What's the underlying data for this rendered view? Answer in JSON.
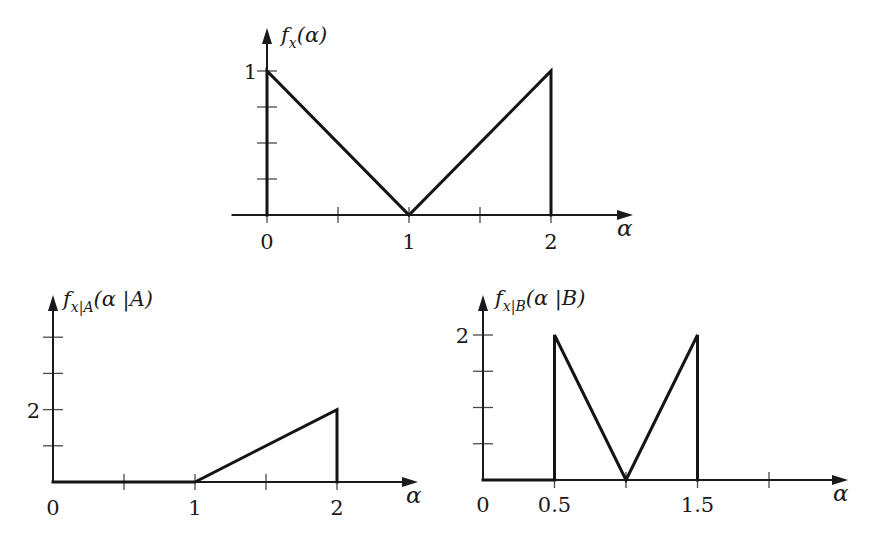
{
  "chart_data": [
    {
      "id": "fx",
      "type": "line",
      "title": "f_x(α)",
      "ylabel": {
        "main": "f",
        "sub": "x",
        "args": "(α)"
      },
      "xlabel": "α",
      "points": [
        [
          0,
          0
        ],
        [
          0,
          1
        ],
        [
          1,
          0
        ],
        [
          2,
          1
        ],
        [
          2,
          0
        ]
      ],
      "x_axis_start": -0.25,
      "x_ticks": [
        0,
        0.5,
        1,
        1.5,
        2
      ],
      "x_tick_labels": [
        {
          "x": 0,
          "label": "0"
        },
        {
          "x": 1,
          "label": "1"
        },
        {
          "x": 2,
          "label": "2"
        }
      ],
      "y_ticks": [
        0.25,
        0.5,
        0.75,
        1
      ],
      "y_tick_labels": [
        {
          "y": 1,
          "label": "1"
        }
      ],
      "xlim": [
        -0.25,
        2.6
      ],
      "ylim": [
        0,
        1.3
      ],
      "grid": false
    },
    {
      "id": "fx_given_A",
      "type": "line",
      "title": "f_x|A(α|A)",
      "ylabel": {
        "main": "f",
        "sub": "x|A",
        "args": "(α |A)"
      },
      "xlabel": "α",
      "points": [
        [
          0,
          0
        ],
        [
          1,
          0
        ],
        [
          2,
          2
        ],
        [
          2,
          0
        ]
      ],
      "x_axis_start": 0,
      "x_ticks": [
        0.5,
        1,
        1.5,
        2
      ],
      "x_tick_labels": [
        {
          "x": 0,
          "label": "0"
        },
        {
          "x": 1,
          "label": "1"
        },
        {
          "x": 2,
          "label": "2"
        }
      ],
      "y_ticks": [
        1,
        2,
        3,
        4
      ],
      "y_tick_labels": [
        {
          "y": 2,
          "label": "2"
        }
      ],
      "xlim": [
        0,
        2.6
      ],
      "ylim": [
        0,
        5.2
      ],
      "grid": false
    },
    {
      "id": "fx_given_B",
      "type": "line",
      "title": "f_x|B(α|B)",
      "ylabel": {
        "main": "f",
        "sub": "x|B",
        "args": "(α |B)"
      },
      "xlabel": "α",
      "points": [
        [
          0,
          0
        ],
        [
          0.5,
          0
        ],
        [
          0.5,
          2
        ],
        [
          1,
          0
        ],
        [
          1.5,
          2
        ],
        [
          1.5,
          0
        ]
      ],
      "x_axis_start": 0,
      "x_ticks": [
        0.5,
        1,
        1.5,
        2
      ],
      "x_tick_labels": [
        {
          "x": 0,
          "label": "0"
        },
        {
          "x": 0.5,
          "label": "0.5"
        },
        {
          "x": 1.5,
          "label": "1.5"
        }
      ],
      "y_ticks": [
        0.5,
        1,
        1.5,
        2
      ],
      "y_tick_labels": [
        {
          "y": 2,
          "label": "2"
        }
      ],
      "xlim": [
        0,
        2.55
      ],
      "ylim": [
        0,
        2.55
      ],
      "grid": false
    }
  ]
}
